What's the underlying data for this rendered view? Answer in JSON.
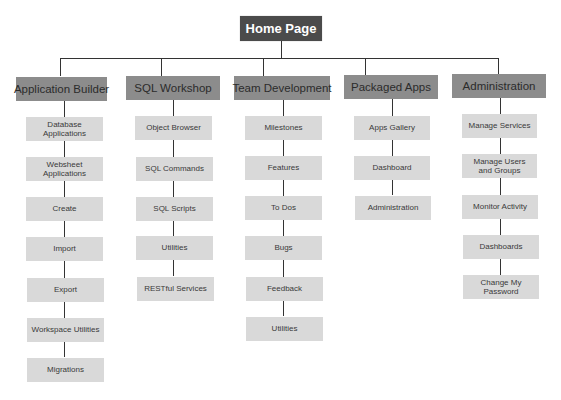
{
  "diagram": {
    "type": "site-map",
    "root": {
      "label": "Home Page"
    },
    "colors": {
      "root_bg": "#4b4b4b",
      "category_bg": "#8c8c8c",
      "item_bg": "#d9d9d9",
      "connector": "#333333"
    },
    "categories": [
      {
        "label": "Application Builder",
        "items": [
          {
            "label": "Database\nApplications"
          },
          {
            "label": "Websheet\nApplications"
          },
          {
            "label": "Create"
          },
          {
            "label": "Import"
          },
          {
            "label": "Export"
          },
          {
            "label": "Workspace Utilities"
          },
          {
            "label": "Migrations"
          }
        ]
      },
      {
        "label": "SQL Workshop",
        "items": [
          {
            "label": "Object Browser"
          },
          {
            "label": "SQL Commands"
          },
          {
            "label": "SQL Scripts"
          },
          {
            "label": "Utilities"
          },
          {
            "label": "RESTful Services"
          }
        ]
      },
      {
        "label": "Team Development",
        "items": [
          {
            "label": "Milestones"
          },
          {
            "label": "Features"
          },
          {
            "label": "To Dos"
          },
          {
            "label": "Bugs"
          },
          {
            "label": "Feedback"
          },
          {
            "label": "Utilities"
          }
        ]
      },
      {
        "label": "Packaged Apps",
        "items": [
          {
            "label": "Apps Gallery"
          },
          {
            "label": "Dashboard"
          },
          {
            "label": "Administration"
          }
        ]
      },
      {
        "label": "Administration",
        "items": [
          {
            "label": "Manage Services"
          },
          {
            "label": "Manage Users\nand Groups"
          },
          {
            "label": "Monitor Activity"
          },
          {
            "label": "Dashboards"
          },
          {
            "label": "Change My\nPassword"
          }
        ]
      }
    ]
  }
}
